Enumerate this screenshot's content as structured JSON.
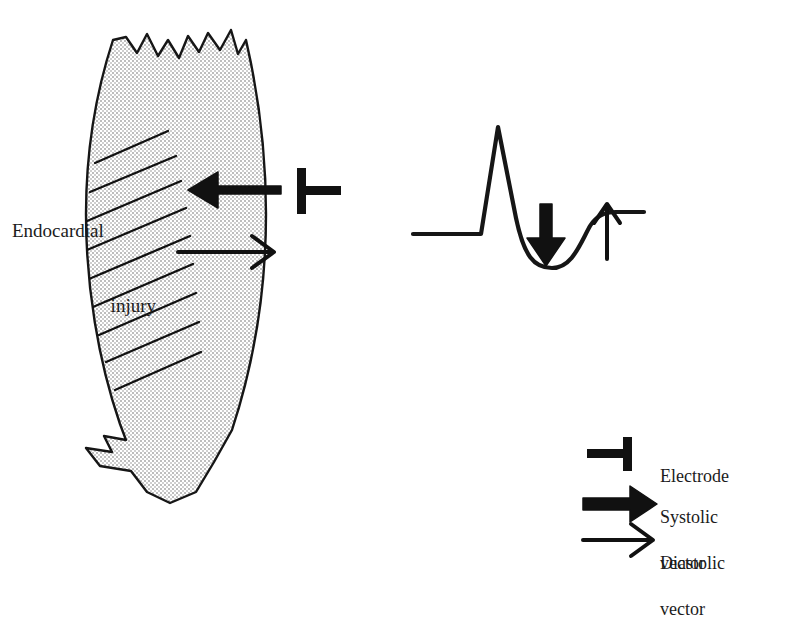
{
  "figure": {
    "type": "medical-diagram",
    "background_color": "#ffffff",
    "ink_color": "#1a1a1a"
  },
  "myocardium": {
    "name": "myocardial-wall",
    "description": "curved crescent-shaped ventricular wall segment with torn jagged top and bottom edges",
    "fill_color": "#c9c9c9",
    "fill_pattern": "fine-stipple-checkerboard",
    "outline_color": "#161616",
    "outline_width": 2,
    "hatching": {
      "name": "endocardial-injury-hatching",
      "line_count": 9,
      "color": "#111111",
      "description": "diagonal lines along inner endocardial surface marking injured zone"
    }
  },
  "annotations": {
    "injury_label_line1": "Endocardial",
    "injury_label_line2": "injury",
    "systolic_arrow_direction": "left",
    "diastolic_arrow_direction": "right",
    "electrode_orientation": "bar-left-stem-right"
  },
  "ecg": {
    "name": "ecg-waveform",
    "description": "baseline, tall sharp R wave, deep ST segment depression trough, recovery to baseline",
    "stroke_color": "#161616",
    "stroke_width": 4,
    "features": [
      "baseline",
      "r-wave-spike",
      "st-depression-trough",
      "return-to-baseline"
    ],
    "down_arrow_meaning": "systolic vector / ST depression",
    "up_arrow_meaning": "diastolic vector / recovery"
  },
  "legend": {
    "name": "vector-legend",
    "items": [
      {
        "symbol": "electrode-symbol",
        "label": "Electrode",
        "label_line2": ""
      },
      {
        "symbol": "thick-arrow-right",
        "label": "Systolic",
        "label_line2": "vector"
      },
      {
        "symbol": "thin-arrow-right",
        "label": "Diastolic",
        "label_line2": "vector"
      }
    ]
  }
}
